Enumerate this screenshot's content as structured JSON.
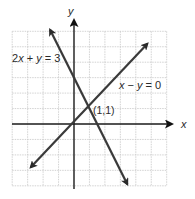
{
  "diagram": {
    "type": "coordinate-plane",
    "grid": {
      "x_min": -4,
      "x_max": 6,
      "y_min": -4,
      "y_max": 6,
      "origin_px": [
        74,
        124
      ],
      "unit_px": 15.45,
      "grid_color": "#c8c8c8",
      "axis_color": "#1a1a1a"
    },
    "axes": {
      "x_label": "x",
      "y_label": "y"
    },
    "lines": [
      {
        "id": "line-2x-plus-y",
        "equation": "2x + y = 3",
        "label_parts": [
          "2",
          "x",
          " + ",
          "y",
          " = 3"
        ],
        "from": [
          -1.55,
          6.1
        ],
        "to": [
          3.45,
          -3.9
        ],
        "color": "#3a3a3a"
      },
      {
        "id": "line-x-minus-y",
        "equation": "x − y = 0",
        "label_parts": [
          "x",
          " − ",
          "y",
          " = 0"
        ],
        "from": [
          -2.8,
          -2.8
        ],
        "to": [
          4.75,
          5.2
        ],
        "color": "#3a3a3a"
      }
    ],
    "intersection": {
      "label": "(1,1)",
      "point": [
        1,
        1
      ]
    }
  }
}
